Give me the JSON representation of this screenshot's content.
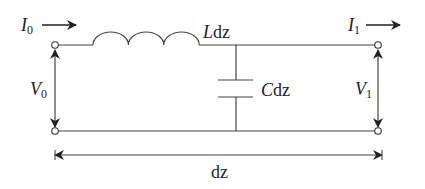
{
  "diagram": {
    "type": "transmission-line-segment",
    "labels": {
      "current_in": {
        "main": "I",
        "sub": "0"
      },
      "current_out": {
        "main": "I",
        "sub": "1"
      },
      "voltage_in": {
        "main": "V",
        "sub": "0"
      },
      "voltage_out": {
        "main": "V",
        "sub": "1"
      },
      "inductor": {
        "main": "L",
        "rest": "dz"
      },
      "capacitor": {
        "main": "C",
        "rest": "dz"
      },
      "length": "dz"
    },
    "colors": {
      "line": "#333333",
      "text": "#222222",
      "background": "#ffffff"
    }
  }
}
